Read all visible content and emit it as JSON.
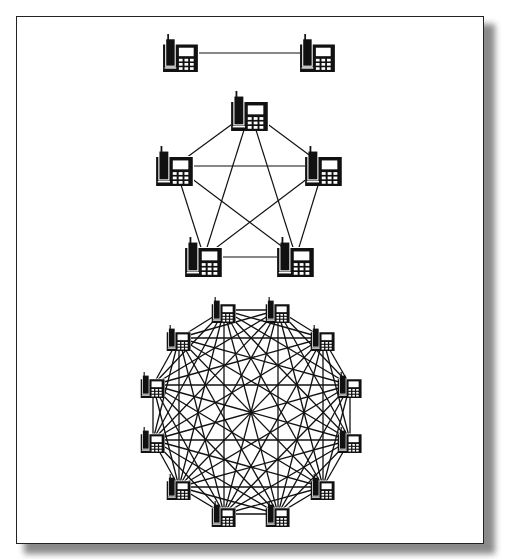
{
  "figure": {
    "colors": {
      "line": "#111111",
      "phone": "#111111",
      "frame": "#222222",
      "shadow": "#8a8a8a",
      "background": "#ffffff"
    }
  },
  "networks": [
    {
      "name": "two-phone-network",
      "node_count": 2,
      "icon_size": 38,
      "nodes": [
        [
          181,
          53
        ],
        [
          318,
          53
        ]
      ],
      "connection_count": 1
    },
    {
      "name": "five-phone-network",
      "node_count": 5,
      "icon_size": 40,
      "nodes": [
        [
          250,
          111
        ],
        [
          175,
          166
        ],
        [
          324,
          166
        ],
        [
          204,
          257
        ],
        [
          296,
          257
        ]
      ],
      "connection_count": 10
    },
    {
      "name": "twelve-phone-network",
      "node_count": 12,
      "icon_size": 26,
      "nodes": [
        [
          224,
          310
        ],
        [
          278,
          310
        ],
        [
          323,
          338
        ],
        [
          350,
          385
        ],
        [
          350,
          440
        ],
        [
          323,
          487
        ],
        [
          278,
          514
        ],
        [
          224,
          514
        ],
        [
          179,
          487
        ],
        [
          153,
          440
        ],
        [
          153,
          385
        ],
        [
          179,
          338
        ]
      ],
      "connection_count": 66
    }
  ]
}
